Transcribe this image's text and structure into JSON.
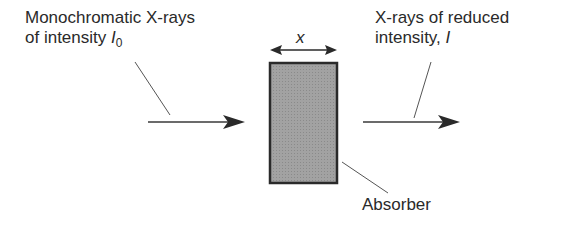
{
  "labels": {
    "incident_line1": "Monochromatic X-rays",
    "incident_line2_prefix": "of intensity ",
    "incident_symbol": "I",
    "incident_subscript": "0",
    "transmitted_line1": "X-rays of reduced",
    "transmitted_line2_prefix": "intensity, ",
    "transmitted_symbol": "I",
    "thickness_symbol": "x",
    "absorber": "Absorber"
  },
  "colors": {
    "absorber_fill": "#9a9a9a",
    "absorber_border": "#2a2a2a",
    "line": "#3a3a3a",
    "text": "#2a2a2a"
  }
}
